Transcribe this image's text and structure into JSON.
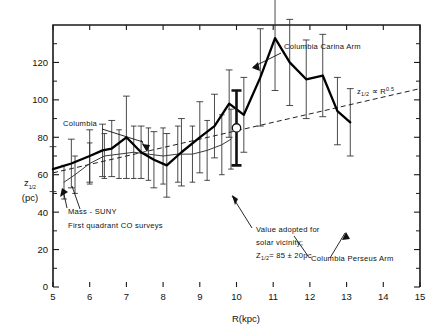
{
  "figure": {
    "background_color": "#ffffff",
    "ink_color": "#111111"
  },
  "chart_data": {
    "type": "line",
    "title": "",
    "xlabel": "R(kpc)",
    "ylabel": "z1/2 (pc)",
    "ylabel_main": "z",
    "ylabel_sub": "1/2",
    "ylabel_units": "(pc)",
    "xlim": [
      5,
      15
    ],
    "ylim": [
      0,
      140
    ],
    "xticks": [
      5,
      6,
      7,
      8,
      9,
      10,
      11,
      12,
      13,
      14,
      15
    ],
    "xticklabels": [
      "5",
      "6",
      "7",
      "8",
      "9",
      "10",
      "11",
      "12",
      "13",
      "14",
      "15"
    ],
    "yticks": [
      0,
      20,
      40,
      60,
      80,
      100,
      120
    ],
    "yticklabels": [
      "0",
      "20",
      "40",
      "60",
      "80",
      "100",
      "120"
    ],
    "yticks_minor": [
      10,
      30,
      50,
      70,
      90,
      110,
      130
    ],
    "grid": false,
    "legend": "none",
    "series": [
      {
        "name": "Columbia",
        "style": "thick-solid",
        "x": [
          5.0,
          5.5,
          6.0,
          6.35,
          6.6,
          7.0,
          7.4,
          7.75,
          8.1,
          8.5,
          9.0,
          9.4,
          9.8,
          10.2,
          10.65,
          11.05,
          11.45,
          11.9,
          12.35,
          12.75,
          13.1
        ],
        "y": [
          63,
          66,
          70,
          73,
          74,
          80,
          72,
          68,
          65,
          72,
          80,
          86,
          98,
          92,
          112,
          133,
          120,
          111,
          113,
          94,
          88
        ],
        "yerr": [
          12,
          13,
          14,
          14,
          15,
          22,
          14,
          15,
          17,
          18,
          19,
          17,
          18,
          20,
          26,
          28,
          23,
          21,
          22,
          18,
          18
        ]
      },
      {
        "name": "Mass-SUNY First quadrant CO surveys",
        "style": "thin-solid",
        "x": [
          5.3,
          5.6,
          6.0,
          6.4,
          6.8,
          7.2,
          7.6,
          8.0,
          8.4,
          8.8,
          9.2,
          9.6,
          9.85
        ],
        "y": [
          56,
          60,
          66,
          70,
          71,
          72,
          71,
          70,
          71,
          71,
          73,
          76,
          79
        ],
        "yerr": [
          9,
          10,
          11,
          12,
          13,
          14,
          14,
          15,
          15,
          15,
          16,
          16,
          16
        ]
      }
    ],
    "reference_line": {
      "name": "power-law reference",
      "style": "dashed",
      "relation_main": "z",
      "relation_sub": "1/2",
      "relation_symbol": " ∝ R",
      "relation_exponent": "0.5",
      "label": "z1/2 ∝ R^0.5",
      "x": [
        5,
        15
      ],
      "y": [
        61,
        106
      ]
    },
    "special_point": {
      "name": "solar vicinity adopted value",
      "marker": "open-circle",
      "x": 10.0,
      "y": 85,
      "yerr": 20,
      "label_lines": [
        "Value adopted for",
        "solar vicinity;",
        "Z1/2 = 85 ± 20pc"
      ],
      "label_line3_main": "Z",
      "label_line3_sub": "1/2",
      "label_line3_rest": "= 85 ± 20pc"
    },
    "annotations": [
      {
        "id": "columbia",
        "text": "Columbia",
        "x_px": 63,
        "y_px": 126
      },
      {
        "id": "mass-suny-line1",
        "text": "Mass - SUNY",
        "x_px": 68,
        "y_px": 214
      },
      {
        "id": "mass-suny-line2",
        "text": "First quadrant CO surveys",
        "x_px": 68,
        "y_px": 228
      },
      {
        "id": "columbia-carina-arm",
        "text": "Columbia  Carina  Arm",
        "x_px": 284,
        "y_px": 49
      },
      {
        "id": "columbia-perseus-arm",
        "text": "Columbia  Perseus  Arm",
        "x_px": 311,
        "y_px": 261
      },
      {
        "id": "solar-vicinity-1",
        "text": "Value adopted for",
        "x_px": 256,
        "y_px": 232
      },
      {
        "id": "solar-vicinity-2",
        "text": "solar  vicinity;",
        "x_px": 256,
        "y_px": 245
      },
      {
        "id": "solar-vicinity-3",
        "text": "= 85 ± 20pc",
        "x_px": 256,
        "y_px": 258
      }
    ]
  }
}
